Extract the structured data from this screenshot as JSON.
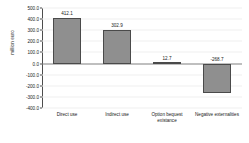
{
  "chart_data": {
    "type": "bar",
    "title": "",
    "xlabel": "",
    "ylabel": "million euro",
    "categories": [
      "Direct use",
      "Indirect use",
      "Option bequest existance",
      "Negative externalities"
    ],
    "values": [
      412.1,
      302.9,
      12.7,
      -268.7
    ],
    "value_labels": [
      "412.1",
      "302.9",
      "12.7",
      "-268.7"
    ],
    "ylim": [
      -400.0,
      500.0
    ],
    "yticks": [
      500.0,
      400.0,
      300.0,
      200.0,
      100.0,
      0.0,
      -100.0,
      -200.0,
      -300.0,
      -400.0
    ],
    "ytick_labels": [
      "500.0",
      "400.0",
      "300.0",
      "200.0",
      "100.0",
      "0.0",
      "-100.0",
      "-200.0",
      "-300.0",
      "-400.0"
    ],
    "grid": true,
    "legend": false,
    "bar_color": "#8f8f8f",
    "bar_border_color": "#4a4a4a",
    "axis_color": "#4d4d4d",
    "background_color": "#ffffff"
  }
}
